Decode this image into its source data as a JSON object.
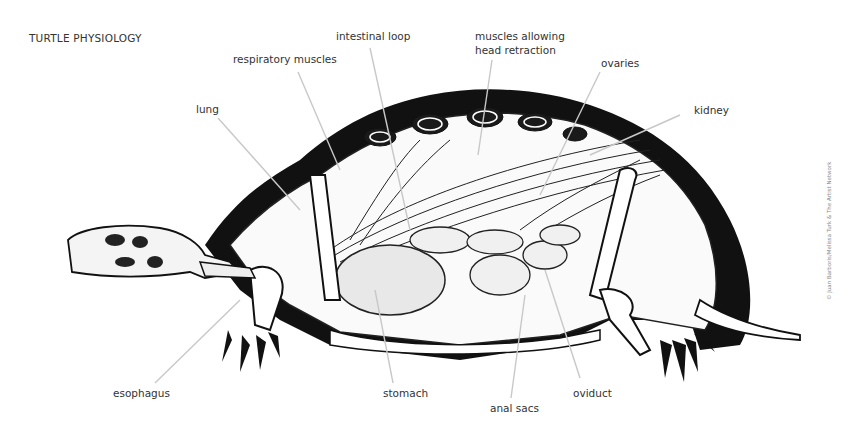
{
  "title": "TURTLE PHYSIOLOGY",
  "labels": {
    "respiratory_muscles": "respiratory muscles",
    "intestinal_loop": "intestinal loop",
    "head_retraction_line1": "muscles allowing",
    "head_retraction_line2": "head retraction",
    "ovaries": "ovaries",
    "kidney": "kidney",
    "lung": "lung",
    "esophagus": "esophagus",
    "stomach": "stomach",
    "anal_sacs": "anal sacs",
    "oviduct": "oviduct"
  },
  "credit": "© Juan Barboris/Melissa Turk & The Artist Network",
  "colors": {
    "ink": "#111111",
    "leader": "#c8c8c8",
    "text": "#333333"
  }
}
